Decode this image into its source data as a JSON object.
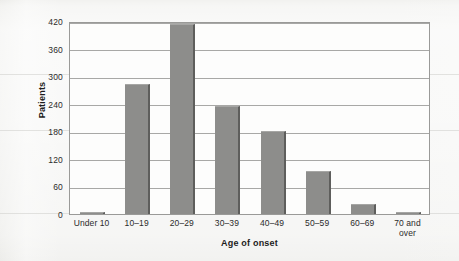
{
  "chart_data": {
    "type": "bar",
    "title": "",
    "xlabel": "Age of onset",
    "ylabel": "Patients",
    "categories": [
      "Under 10",
      "10–19",
      "20–29",
      "30–39",
      "40–49",
      "50–59",
      "60–69",
      "70 and\nover"
    ],
    "category_lines": [
      [
        "Under 10"
      ],
      [
        "10–19"
      ],
      [
        "20–29"
      ],
      [
        "30–39"
      ],
      [
        "40–49"
      ],
      [
        "50–59"
      ],
      [
        "60–69"
      ],
      [
        "70 and",
        "over"
      ]
    ],
    "values": [
      3,
      283,
      413,
      235,
      180,
      94,
      22,
      5
    ],
    "ylim": [
      0,
      420
    ],
    "yticks": [
      0,
      60,
      120,
      180,
      240,
      300,
      360,
      420
    ],
    "ytick_labels": [
      "0",
      "60",
      "120",
      "180",
      "240",
      "300",
      "360",
      "420"
    ],
    "grid": true,
    "legend": "none",
    "bar_color": "#8d8d8b",
    "bar_edge_color": "#5e5e5c",
    "plot_background": "#fdfdfc",
    "page_background": "#f2f2f0",
    "axis_color": "#9a9a98",
    "gridline_color": "#a8a8a6"
  }
}
